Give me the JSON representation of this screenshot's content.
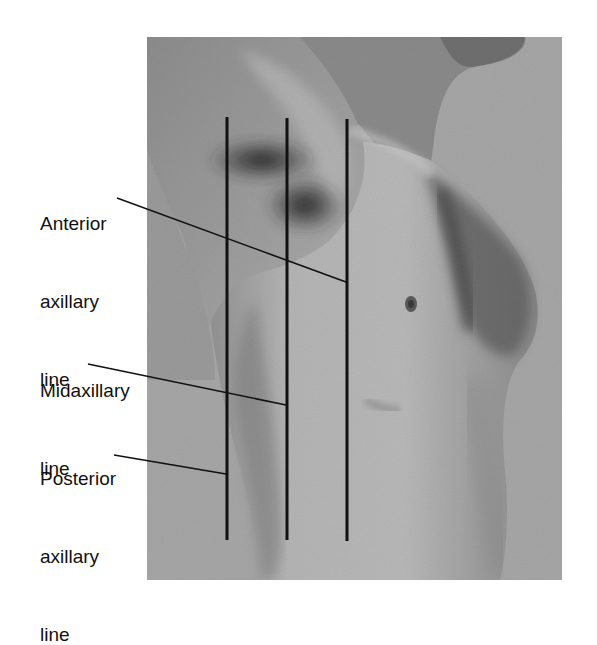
{
  "figure": {
    "type": "anatomical-photo-diagram",
    "photo_frame": {
      "x": 147,
      "y": 37,
      "width": 415,
      "height": 543
    },
    "background_color": "#a6a6a6",
    "line_color": "#111111"
  },
  "labels": [
    {
      "id": "anterior",
      "lines": [
        "Anterior",
        "axillary",
        "line"
      ],
      "leader": {
        "x1": 117,
        "y1": 198,
        "x2": 346,
        "y2": 282
      }
    },
    {
      "id": "midaxillary",
      "lines": [
        "Midaxillary",
        "line"
      ],
      "leader": {
        "x1": 88,
        "y1": 364,
        "x2": 286,
        "y2": 405
      }
    },
    {
      "id": "posterior",
      "lines": [
        "Posterior",
        "axillary",
        "line"
      ],
      "leader": {
        "x1": 114,
        "y1": 455,
        "x2": 226,
        "y2": 474
      }
    }
  ],
  "vertical_lines": [
    {
      "name": "posterior-axillary",
      "x": 227,
      "y1": 117,
      "y2": 540
    },
    {
      "name": "midaxillary",
      "x": 287,
      "y1": 118,
      "y2": 540
    },
    {
      "name": "anterior-axillary",
      "x": 347,
      "y1": 119,
      "y2": 541
    }
  ]
}
